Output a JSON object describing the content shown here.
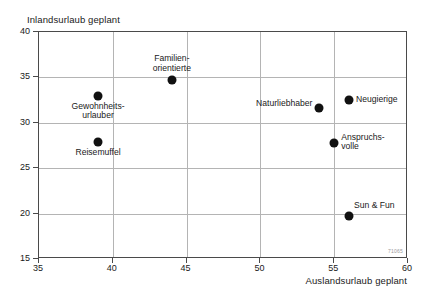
{
  "chart_data": {
    "type": "scatter",
    "title": "",
    "xlabel": "Auslandsurlaub geplant",
    "ylabel": "Inlandsurlaub geplant",
    "xlim": [
      35,
      60
    ],
    "ylim": [
      15,
      40
    ],
    "xticks": [
      35,
      40,
      45,
      50,
      55,
      60
    ],
    "yticks": [
      15,
      20,
      25,
      30,
      35,
      40
    ],
    "grid": true,
    "legend": "none",
    "watermark": "71065",
    "points": [
      {
        "label": "Gewohnheits-\nurlauber",
        "x": 39.0,
        "y": 33.0,
        "label_pos": "below"
      },
      {
        "label": "Reisemuffel",
        "x": 39.0,
        "y": 27.9,
        "label_pos": "below"
      },
      {
        "label": "Familien-\norientierte",
        "x": 44.0,
        "y": 34.7,
        "label_pos": "above"
      },
      {
        "label": "Naturliebhaber",
        "x": 54.0,
        "y": 31.6,
        "label_pos": "left"
      },
      {
        "label": "Neugierige",
        "x": 56.0,
        "y": 32.5,
        "label_pos": "right"
      },
      {
        "label": "Anspruchs-\nvolle",
        "x": 55.0,
        "y": 27.8,
        "label_pos": "right"
      },
      {
        "label": "Sun & Fun",
        "x": 56.0,
        "y": 19.7,
        "label_pos": "above-right"
      }
    ]
  },
  "colors": {
    "point": "#111111",
    "frame": "#4a4a4a",
    "grid": "#b4b4b4",
    "text": "#1a1a1a",
    "background": "#ffffff"
  }
}
